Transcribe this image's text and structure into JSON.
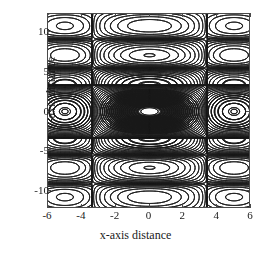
{
  "chart_data": {
    "type": "contour",
    "title": "",
    "xlabel": "x-axis distance",
    "ylabel": "y-axis distance",
    "xlim": [
      -6,
      6
    ],
    "ylim": [
      -12.2,
      12.2
    ],
    "xticks": [
      -6,
      -4,
      -2,
      0,
      2,
      4,
      6
    ],
    "xtick_labels": [
      "-6",
      "-4",
      "-2",
      "0",
      "2",
      "4",
      "6"
    ],
    "yticks": [
      10,
      5,
      0,
      -5,
      -10
    ],
    "ytick_labels": [
      "10",
      "5",
      "0",
      "-5",
      "-10"
    ],
    "grid": false,
    "legend": null,
    "line_color": "#1a1a1a",
    "frame_color": "#4a4a4a",
    "background": "#ffffff",
    "n_levels": 30,
    "peaks": [
      {
        "x": 0,
        "y": 0,
        "relative_amplitude": 1.0,
        "kind": "main-lobe"
      },
      {
        "x": -5,
        "y": 0,
        "relative_amplitude": 0.35,
        "kind": "side-lobe"
      },
      {
        "x": 5,
        "y": 0,
        "relative_amplitude": 0.35,
        "kind": "side-lobe"
      },
      {
        "x": 0,
        "y": 5,
        "relative_amplitude": 0.3,
        "kind": "side-lobe"
      },
      {
        "x": 0,
        "y": -5,
        "relative_amplitude": 0.3,
        "kind": "side-lobe"
      },
      {
        "x": 0,
        "y": 8.5,
        "relative_amplitude": 0.2,
        "kind": "side-lobe"
      },
      {
        "x": 0,
        "y": -8.5,
        "relative_amplitude": 0.2,
        "kind": "side-lobe"
      },
      {
        "x": 0,
        "y": 12.2,
        "relative_amplitude": 0.16,
        "kind": "clipped-lobe"
      },
      {
        "x": 0,
        "y": -12.2,
        "relative_amplitude": 0.16,
        "kind": "clipped-lobe"
      },
      {
        "x": -5,
        "y": 5,
        "relative_amplitude": 0.1,
        "kind": "corner-lobe"
      },
      {
        "x": 5,
        "y": 5,
        "relative_amplitude": 0.1,
        "kind": "corner-lobe"
      },
      {
        "x": -5,
        "y": -5,
        "relative_amplitude": 0.1,
        "kind": "corner-lobe"
      },
      {
        "x": 5,
        "y": -5,
        "relative_amplitude": 0.1,
        "kind": "corner-lobe"
      },
      {
        "x": -5,
        "y": 8.5,
        "relative_amplitude": 0.06,
        "kind": "corner-lobe"
      },
      {
        "x": 5,
        "y": 8.5,
        "relative_amplitude": 0.06,
        "kind": "corner-lobe"
      },
      {
        "x": -5,
        "y": -8.5,
        "relative_amplitude": 0.06,
        "kind": "corner-lobe"
      },
      {
        "x": 5,
        "y": -8.5,
        "relative_amplitude": 0.06,
        "kind": "corner-lobe"
      }
    ]
  }
}
